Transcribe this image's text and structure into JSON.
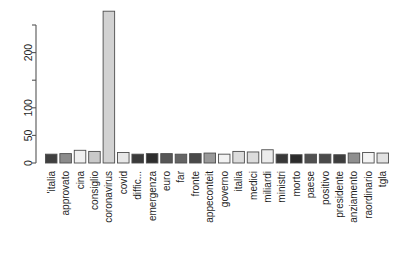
{
  "chart_data": {
    "type": "bar",
    "title": "",
    "subtitle": "",
    "xlabel": "",
    "ylabel": "",
    "grid": false,
    "legend": "none",
    "ylim": [
      0,
      275
    ],
    "y_ticks": [
      0,
      50,
      100,
      150,
      200,
      250
    ],
    "y_tick_labels": [
      "0",
      "50",
      "100",
      "",
      "200",
      ""
    ],
    "categories": [
      "'italia",
      "approvato",
      "cina",
      "consiglio",
      "coronavirus",
      "covid",
      "diffic...",
      "emergenza",
      "euro",
      "far",
      "fronte",
      "appeconteit",
      "governo",
      "italia",
      "medici",
      "miliardi",
      "ministri",
      "morto",
      "paese",
      "positivo",
      "presidente",
      "anziamento",
      "raordinario",
      "tgla"
    ],
    "values": [
      16,
      17,
      23,
      21,
      275,
      19,
      16,
      17,
      17,
      16,
      17,
      18,
      16,
      21,
      20,
      24,
      16,
      15,
      16,
      16,
      15,
      18,
      19,
      18
    ],
    "bar_colors": [
      "#3f3f3f",
      "#8c8c8c",
      "#f0f0f0",
      "#c9c9c9",
      "#d2d2d2",
      "#e8e8e8",
      "#3a3a3a",
      "#2e2e2e",
      "#565656",
      "#646464",
      "#494949",
      "#9a9a9a",
      "#f2f2f2",
      "#dcdcdc",
      "#dcdcdc",
      "#ececec",
      "#383838",
      "#2b2b2b",
      "#505050",
      "#4a4a4a",
      "#3d3d3d",
      "#8f8f8f",
      "#f4f4f4",
      "#e2e2e2"
    ],
    "bar_border_color": "#4d4d4d"
  },
  "axis": {
    "y_axis_name": "y-axis",
    "x_axis_name": "x-axis-categories"
  }
}
